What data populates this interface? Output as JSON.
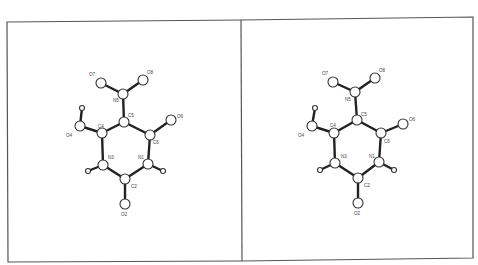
{
  "diagram": {
    "type": "stereo-pair molecular structure",
    "panels": [
      {
        "name": "left",
        "atoms": [
          {
            "id": "O7",
            "x": 101,
            "y": 83,
            "r": 5,
            "lx": 89,
            "ly": 76
          },
          {
            "id": "O8",
            "x": 143,
            "y": 80,
            "r": 5,
            "lx": 147,
            "ly": 74
          },
          {
            "id": "N5",
            "x": 123,
            "y": 94,
            "r": 5,
            "lx": 113,
            "ly": 102
          },
          {
            "id": "C5",
            "x": 124,
            "y": 122,
            "r": 5,
            "lx": 128,
            "ly": 117
          },
          {
            "id": "O6",
            "x": 171,
            "y": 120,
            "r": 5,
            "lx": 177,
            "ly": 118
          },
          {
            "id": "C6",
            "x": 150,
            "y": 135,
            "r": 5,
            "lx": 153,
            "ly": 144
          },
          {
            "id": "C4",
            "x": 102,
            "y": 133,
            "r": 5,
            "lx": 98,
            "ly": 128
          },
          {
            "id": "O4",
            "x": 80,
            "y": 126,
            "r": 5,
            "lx": 66,
            "ly": 137
          },
          {
            "id": "H4",
            "x": 82,
            "y": 108,
            "r": 2.5,
            "lx": null,
            "ly": null
          },
          {
            "id": "N3",
            "x": 103,
            "y": 165,
            "r": 5,
            "lx": 108,
            "ly": 159
          },
          {
            "id": "N1",
            "x": 148,
            "y": 164,
            "r": 5,
            "lx": 138,
            "ly": 159
          },
          {
            "id": "H3",
            "x": 88,
            "y": 171,
            "r": 2.5,
            "lx": null,
            "ly": null
          },
          {
            "id": "H1",
            "x": 163,
            "y": 171,
            "r": 2.5,
            "lx": null,
            "ly": null
          },
          {
            "id": "C2",
            "x": 125,
            "y": 179,
            "r": 5,
            "lx": 131,
            "ly": 188
          },
          {
            "id": "O2",
            "x": 125,
            "y": 204,
            "r": 5,
            "lx": 121,
            "ly": 216
          }
        ]
      },
      {
        "name": "right",
        "atoms": [
          {
            "id": "O7",
            "x": 333,
            "y": 82,
            "r": 5,
            "lx": 322,
            "ly": 75
          },
          {
            "id": "O8",
            "x": 375,
            "y": 78,
            "r": 5,
            "lx": 379,
            "ly": 72
          },
          {
            "id": "N5",
            "x": 355,
            "y": 92,
            "r": 5,
            "lx": 345,
            "ly": 101
          },
          {
            "id": "C5",
            "x": 357,
            "y": 120,
            "r": 5,
            "lx": 361,
            "ly": 116
          },
          {
            "id": "O6",
            "x": 403,
            "y": 124,
            "r": 5,
            "lx": 409,
            "ly": 121
          },
          {
            "id": "C6",
            "x": 381,
            "y": 133,
            "r": 5,
            "lx": 384,
            "ly": 143
          },
          {
            "id": "C4",
            "x": 334,
            "y": 133,
            "r": 5,
            "lx": 330,
            "ly": 127
          },
          {
            "id": "O4",
            "x": 312,
            "y": 126,
            "r": 5,
            "lx": 298,
            "ly": 137
          },
          {
            "id": "H4",
            "x": 315,
            "y": 108,
            "r": 2.5,
            "lx": null,
            "ly": null
          },
          {
            "id": "N3",
            "x": 335,
            "y": 163,
            "r": 5,
            "lx": 341,
            "ly": 158
          },
          {
            "id": "N1",
            "x": 379,
            "y": 162,
            "r": 5,
            "lx": 369,
            "ly": 158
          },
          {
            "id": "H3",
            "x": 320,
            "y": 170,
            "r": 2.5,
            "lx": null,
            "ly": null
          },
          {
            "id": "H1",
            "x": 394,
            "y": 170,
            "r": 2.5,
            "lx": null,
            "ly": null
          },
          {
            "id": "C2",
            "x": 358,
            "y": 178,
            "r": 5,
            "lx": 364,
            "ly": 187
          },
          {
            "id": "O2",
            "x": 358,
            "y": 203,
            "r": 5,
            "lx": 354,
            "ly": 215
          }
        ]
      }
    ],
    "bonds": [
      [
        "N5",
        "O7"
      ],
      [
        "N5",
        "O8"
      ],
      [
        "N5",
        "C5"
      ],
      [
        "C5",
        "C4"
      ],
      [
        "C5",
        "C6"
      ],
      [
        "C6",
        "O6"
      ],
      [
        "C4",
        "O4"
      ],
      [
        "O4",
        "H4"
      ],
      [
        "C4",
        "N3"
      ],
      [
        "C6",
        "N1"
      ],
      [
        "N3",
        "C2"
      ],
      [
        "N1",
        "C2"
      ],
      [
        "N3",
        "H3"
      ],
      [
        "N1",
        "H1"
      ],
      [
        "C2",
        "O2"
      ]
    ],
    "frame": {
      "left": 7,
      "top": 21,
      "right": 473,
      "bottom": 262,
      "divider_x": 241
    }
  }
}
